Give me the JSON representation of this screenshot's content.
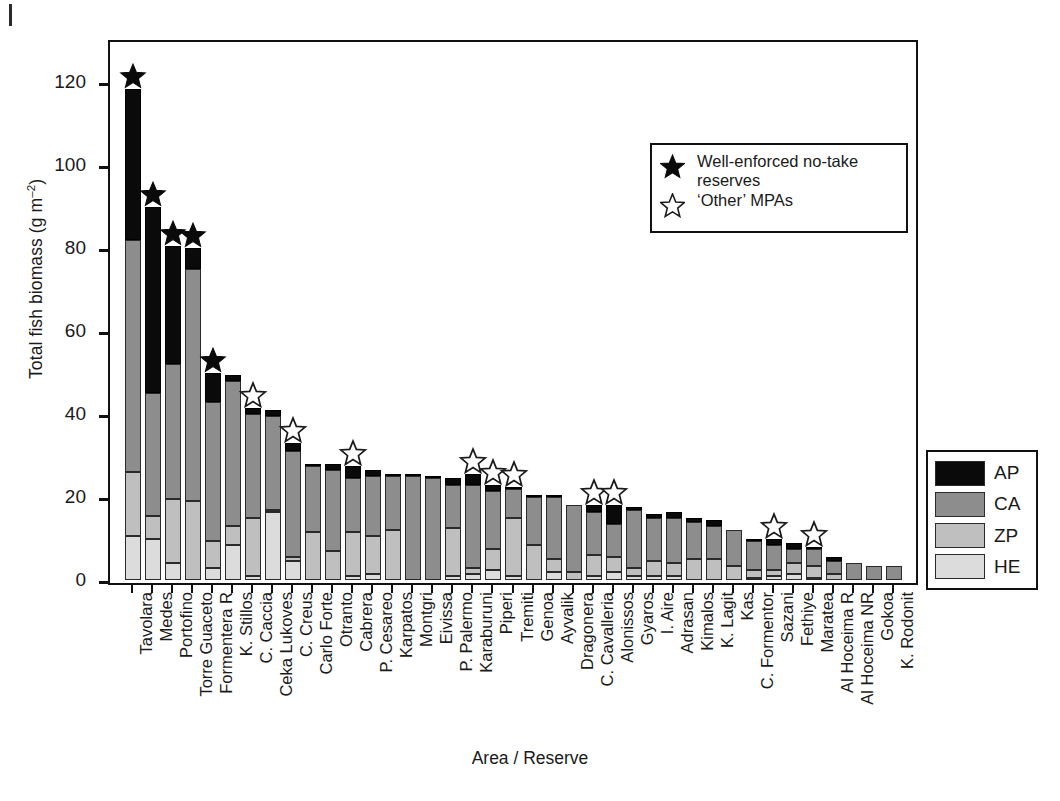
{
  "chart_data": {
    "type": "bar",
    "subtype": "stacked-bar",
    "title": "",
    "xlabel": "Area / Reserve",
    "ylabel": "Total fish biomass (g m−2)",
    "ylabel_base": "Total fish biomass (g m",
    "ylabel_sup": "–2",
    "ylabel_tail": ")",
    "ylim": [
      0,
      130
    ],
    "yticks": [
      0,
      20,
      40,
      60,
      80,
      100,
      120
    ],
    "grid": false,
    "legend_position": "right",
    "series_order": [
      "HE",
      "ZP",
      "CA",
      "AP"
    ],
    "series_colors": {
      "AP": "#0a0a0a",
      "CA": "#8d8d8d",
      "ZP": "#bfbfbf",
      "HE": "#dcdcdc"
    },
    "categories": [
      "Tavolara",
      "Medes",
      "Portofino",
      "Torre Guaceto",
      "Formentera R",
      "K. Stillos",
      "C. Caccia",
      "Ceka Lukoves",
      "C. Creus",
      "Carlo Forte",
      "Otranto",
      "Cabrera",
      "P. Cesareo",
      "Karpatos",
      "Montgri",
      "Eivissa",
      "P. Palermo",
      "Karaburuni",
      "Piperi",
      "Tremiti",
      "Genoa",
      "Ayvalik",
      "Dragonera",
      "C. Cavalleria",
      "Alonissos",
      "Gyaros",
      "I. Aire",
      "Adrasan",
      "Kimalos",
      "K. Lagit",
      "Kas",
      "C. Formentor",
      "Sazani",
      "Fethiye",
      "Maratea",
      "Al Hoceima R",
      "Al Hoceima NR",
      "Gokoa",
      "K. Rodonit"
    ],
    "series": [
      {
        "name": "HE",
        "values": [
          10.5,
          10.0,
          4.0,
          0.0,
          3.0,
          8.5,
          1.0,
          16.5,
          4.5,
          0.0,
          0.0,
          1.0,
          1.5,
          0.0,
          0.0,
          0.0,
          1.0,
          1.5,
          2.5,
          1.0,
          0.0,
          2.0,
          0.0,
          1.0,
          2.0,
          1.0,
          1.0,
          1.0,
          0.0,
          0.0,
          0.0,
          0.5,
          1.0,
          1.5,
          0.5,
          0.0,
          0.0,
          0.0,
          0.0
        ]
      },
      {
        "name": "ZP",
        "values": [
          15.5,
          5.5,
          15.5,
          19.0,
          6.5,
          4.5,
          14.0,
          0.5,
          1.0,
          11.5,
          7.0,
          10.5,
          9.0,
          12.0,
          0.0,
          0.0,
          11.5,
          1.5,
          5.0,
          14.0,
          8.5,
          3.0,
          2.0,
          5.0,
          3.5,
          2.0,
          3.5,
          3.0,
          5.0,
          5.0,
          3.5,
          2.0,
          1.5,
          2.5,
          3.0,
          1.5,
          0.0,
          0.0,
          0.0
        ]
      },
      {
        "name": "CA",
        "values": [
          56.0,
          29.5,
          32.5,
          56.0,
          33.5,
          35.0,
          25.0,
          22.5,
          25.5,
          16.0,
          19.5,
          13.0,
          14.5,
          13.0,
          25.0,
          24.5,
          10.5,
          20.0,
          14.0,
          7.0,
          11.5,
          15.0,
          16.0,
          10.5,
          8.0,
          14.0,
          10.5,
          11.0,
          9.0,
          8.0,
          8.5,
          7.0,
          6.0,
          3.5,
          4.0,
          3.0,
          4.0,
          3.5,
          3.5
        ]
      },
      {
        "name": "AP",
        "values": [
          36.5,
          45.0,
          28.5,
          5.0,
          7.0,
          1.5,
          1.5,
          1.5,
          2.0,
          0.5,
          1.5,
          3.0,
          1.5,
          0.5,
          0.5,
          0.5,
          1.5,
          2.5,
          1.5,
          0.5,
          0.5,
          0.5,
          0.0,
          1.5,
          4.5,
          0.5,
          1.0,
          1.5,
          1.0,
          1.5,
          0.0,
          0.5,
          1.5,
          1.5,
          0.5,
          1.0,
          0.0,
          0.0,
          0.0
        ]
      }
    ],
    "totals": [
      118.5,
      90.0,
      80.5,
      80.0,
      50.0,
      49.5,
      41.5,
      41.0,
      33.0,
      28.0,
      28.0,
      27.5,
      26.5,
      25.5,
      25.5,
      25.0,
      24.5,
      25.5,
      23.0,
      22.5,
      20.5,
      20.5,
      18.0,
      18.0,
      18.0,
      17.0,
      16.0,
      16.5,
      15.0,
      14.5,
      12.0,
      10.0,
      10.0,
      9.0,
      8.0,
      5.5,
      4.0,
      3.5,
      3.5
    ],
    "annotations": {
      "filled_star_categories": [
        "Tavolara",
        "Medes",
        "Portofino",
        "Torre Guaceto",
        "Formentera R"
      ],
      "open_star_categories": [
        "C. Caccia",
        "C. Creus",
        "Cabrera",
        "Karaburuni",
        "Piperi",
        "Tremiti",
        "C. Cavalleria",
        "Alonissos",
        "Sazani",
        "Maratea"
      ]
    }
  },
  "star_legend": {
    "filled_label_line1": "Well-enforced no-take",
    "filled_label_line2": "reserves",
    "open_label": "‘Other’ MPAs"
  },
  "category_legend": {
    "items": [
      {
        "code": "AP",
        "color": "#0a0a0a"
      },
      {
        "code": "CA",
        "color": "#8d8d8d"
      },
      {
        "code": "ZP",
        "color": "#bfbfbf"
      },
      {
        "code": "HE",
        "color": "#dcdcdc"
      }
    ]
  }
}
